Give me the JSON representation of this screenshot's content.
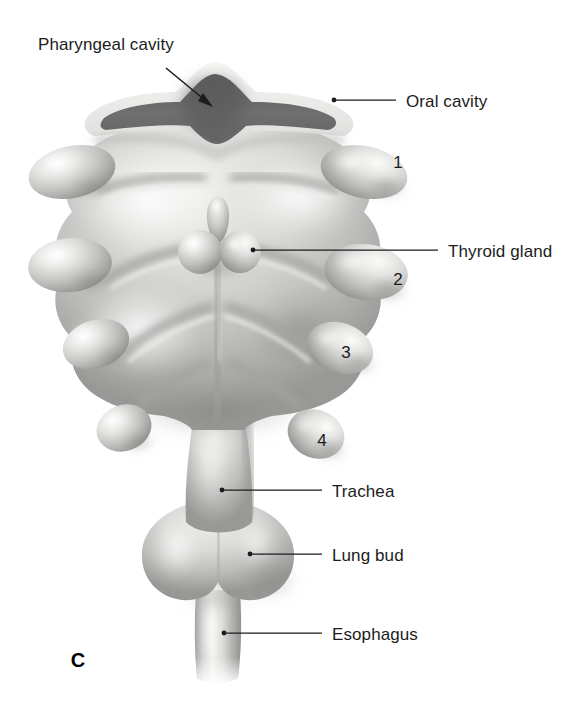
{
  "figure": {
    "panel_letter": "C",
    "background_color": "#ffffff",
    "ink_color": "#1c1c1c"
  },
  "labels": [
    {
      "id": "pharyngeal-cavity",
      "text": "Pharyngeal cavity",
      "text_x": 38,
      "text_y": 50,
      "anchor": "start",
      "connector": "arrow",
      "arrow_from_x": 166,
      "arrow_from_y": 68,
      "arrow_to_x": 213,
      "arrow_to_y": 107
    },
    {
      "id": "oral-cavity",
      "text": "Oral cavity",
      "text_x": 406,
      "text_y": 107,
      "anchor": "start",
      "connector": "line-dot",
      "dot_x": 334,
      "dot_y": 100,
      "line_to_x": 396,
      "line_to_y": 100
    },
    {
      "id": "thyroid-gland",
      "text": "Thyroid gland",
      "text_x": 448,
      "text_y": 257,
      "anchor": "start",
      "connector": "line-dot",
      "dot_x": 253,
      "dot_y": 250,
      "line_to_x": 438,
      "line_to_y": 250
    },
    {
      "id": "trachea",
      "text": "Trachea",
      "text_x": 332,
      "text_y": 497,
      "anchor": "start",
      "connector": "line-dot",
      "dot_x": 222,
      "dot_y": 490,
      "line_to_x": 322,
      "line_to_y": 490
    },
    {
      "id": "lung-bud",
      "text": "Lung bud",
      "text_x": 332,
      "text_y": 561,
      "anchor": "start",
      "connector": "line-dot",
      "dot_x": 250,
      "dot_y": 554,
      "line_to_x": 322,
      "line_to_y": 554
    },
    {
      "id": "esophagus",
      "text": "Esophagus",
      "text_x": 332,
      "text_y": 640,
      "anchor": "start",
      "connector": "line-dot",
      "dot_x": 224,
      "dot_y": 633,
      "line_to_x": 322,
      "line_to_y": 633
    }
  ],
  "arch_numbers": [
    {
      "id": "arch-1",
      "text": "1",
      "x": 398,
      "y": 168
    },
    {
      "id": "arch-2",
      "text": "2",
      "x": 398,
      "y": 285
    },
    {
      "id": "arch-3",
      "text": "3",
      "x": 346,
      "y": 358
    },
    {
      "id": "arch-4",
      "text": "4",
      "x": 322,
      "y": 446
    }
  ],
  "palette": {
    "tissue_light": "#f2f2f0",
    "tissue_mid": "#c8c8c6",
    "tissue_shadow": "#9a9a98",
    "tissue_deep": "#7e7e7c",
    "cavity_dark": "#6e6e6e",
    "cavity_darker": "#5a5a5a",
    "rim_light": "#ececeb",
    "outline": "#1c1c1c"
  }
}
